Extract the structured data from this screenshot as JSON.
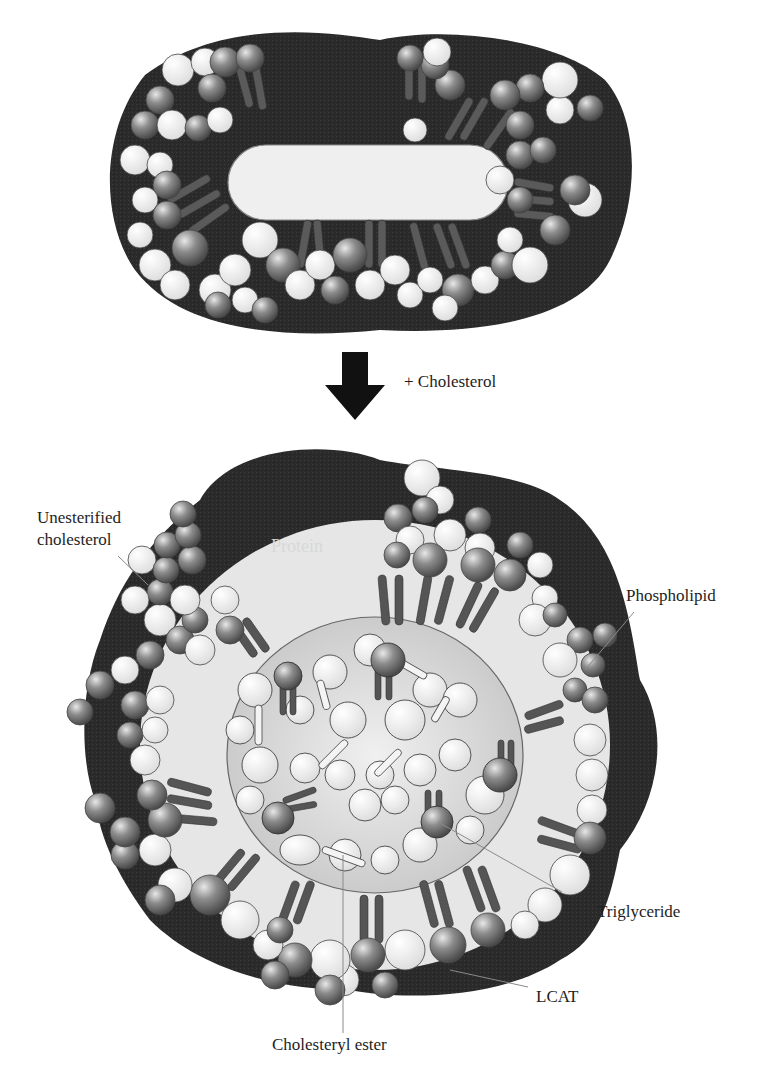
{
  "figure": {
    "top_particle": {
      "name": "Discoidal HDL particle"
    },
    "transition": {
      "arrow": "down-arrow",
      "label": "+ Cholesterol"
    },
    "bottom_particle": {
      "name": "Spherical HDL particle"
    },
    "labels": {
      "unesterified_line1": "Unesterified",
      "unesterified_line2": "cholesterol",
      "protein": "Protein",
      "phospholipid": "Phospholipid",
      "triglyceride": "Triglyceride",
      "lcat": "LCAT",
      "cholesteryl_ester": "Cholesteryl ester"
    },
    "colors": {
      "protein": "#2a2a2a",
      "core": "#d4d4d4",
      "phospholipid_head": "#8a8a8a",
      "cholesterol_sphere": "#f2f2f2",
      "tail": "#555555"
    }
  }
}
